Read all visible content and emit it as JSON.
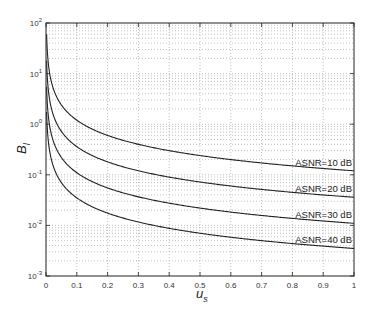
{
  "chart_data": {
    "type": "line",
    "title": "",
    "xlabel": "u_s",
    "ylabel": "B_l",
    "yscale": "log",
    "xlim": [
      0,
      1
    ],
    "ylim": [
      0.001,
      100
    ],
    "grid": true,
    "x_ticks": [
      "0",
      "0.1",
      "0.2",
      "0.3",
      "0.4",
      "0.5",
      "0.6",
      "0.7",
      "0.8",
      "0.9",
      "1"
    ],
    "y_ticks": [
      {
        "base": "10",
        "exp": "2"
      },
      {
        "base": "10",
        "exp": "1"
      },
      {
        "base": "10",
        "exp": "0"
      },
      {
        "base": "10",
        "exp": "-1"
      },
      {
        "base": "10",
        "exp": "-2"
      },
      {
        "base": "10",
        "exp": "-3"
      }
    ],
    "x": [
      0.005,
      0.01,
      0.02,
      0.05,
      0.1,
      0.15,
      0.2,
      0.3,
      0.4,
      0.5,
      0.6,
      0.7,
      0.8,
      0.9,
      1.0
    ],
    "series": [
      {
        "name": "ASNR=10 dB",
        "values": [
          24,
          12,
          6.0,
          2.4,
          1.25,
          0.84,
          0.63,
          0.42,
          0.32,
          0.26,
          0.21,
          0.18,
          0.155,
          0.135,
          0.12
        ]
      },
      {
        "name": "ASNR=20 dB",
        "values": [
          7.5,
          3.7,
          1.85,
          0.74,
          0.37,
          0.25,
          0.19,
          0.125,
          0.095,
          0.077,
          0.064,
          0.055,
          0.047,
          0.041,
          0.036
        ]
      },
      {
        "name": "ASNR=30 dB",
        "values": [
          2.3,
          1.15,
          0.57,
          0.23,
          0.115,
          0.078,
          0.058,
          0.039,
          0.029,
          0.024,
          0.019,
          0.016,
          0.014,
          0.0125,
          0.011
        ]
      },
      {
        "name": "ASNR=40 dB",
        "values": [
          0.72,
          0.36,
          0.18,
          0.072,
          0.036,
          0.025,
          0.019,
          0.0125,
          0.0093,
          0.0074,
          0.0062,
          0.0053,
          0.0046,
          0.004,
          0.0035
        ]
      }
    ],
    "annotations": [
      "ASNR=10 dB",
      "ASNR=20 dB",
      "ASNR=30 dB",
      "ASNR=40 dB"
    ],
    "legend_position": "inline, right end of each curve"
  }
}
